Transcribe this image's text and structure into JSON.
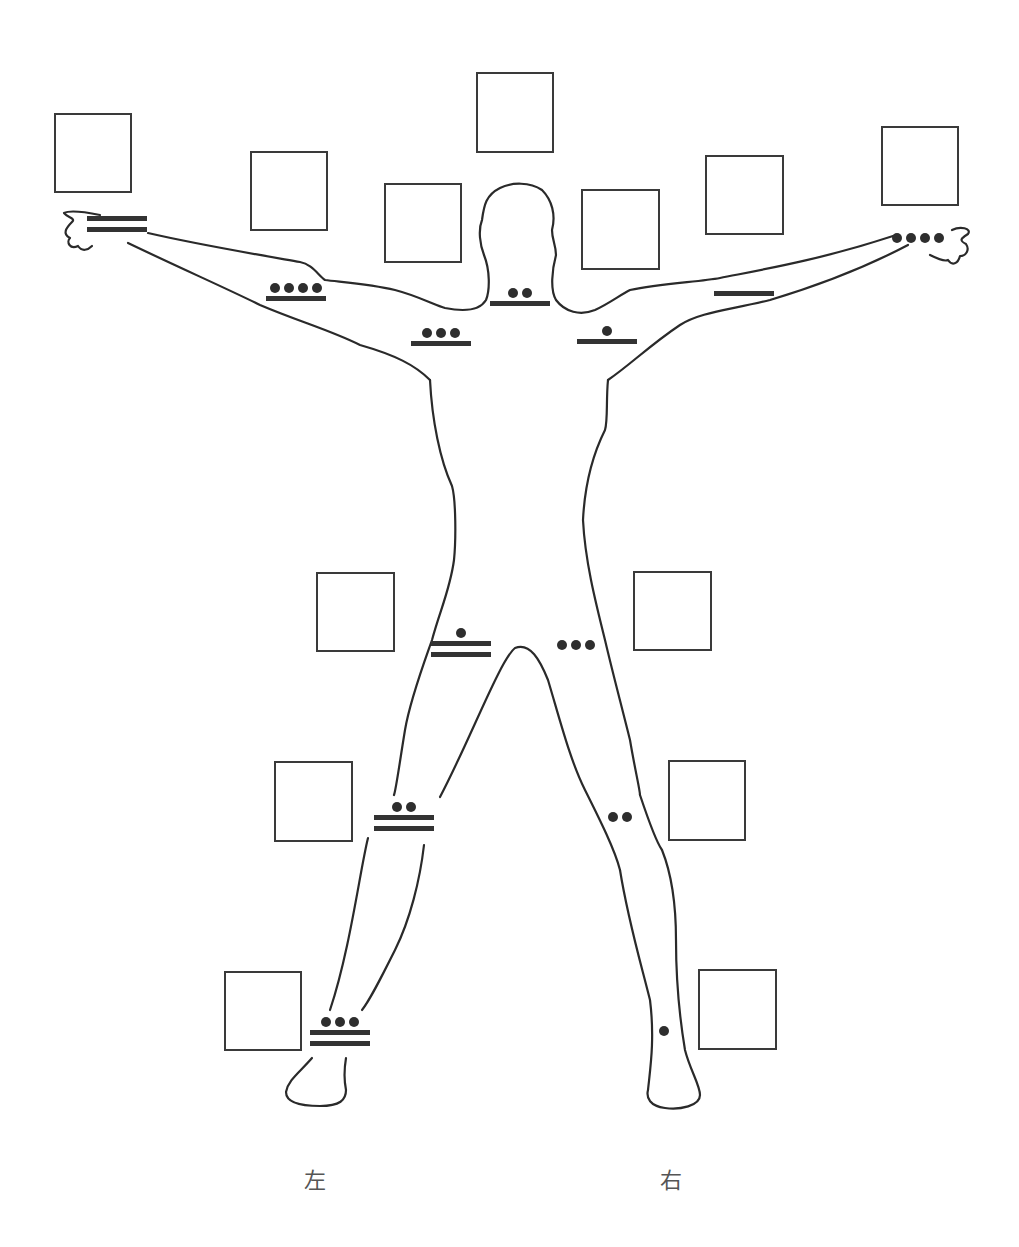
{
  "diagram": {
    "labels": {
      "left": "左",
      "right": "右"
    },
    "numerals": [
      {
        "id": "left-hand",
        "bars": 2,
        "dots": 0,
        "value": 10
      },
      {
        "id": "left-elbow",
        "bars": 1,
        "dots": 4,
        "value": 9
      },
      {
        "id": "left-shoulder",
        "bars": 1,
        "dots": 3,
        "value": 8
      },
      {
        "id": "neck",
        "bars": 1,
        "dots": 2,
        "value": 7
      },
      {
        "id": "right-shoulder",
        "bars": 1,
        "dots": 1,
        "value": 6
      },
      {
        "id": "right-elbow",
        "bars": 1,
        "dots": 0,
        "value": 5
      },
      {
        "id": "right-hand",
        "bars": 0,
        "dots": 4,
        "value": 4
      },
      {
        "id": "left-hip",
        "bars": 2,
        "dots": 1,
        "value": 11
      },
      {
        "id": "right-hip",
        "bars": 0,
        "dots": 3,
        "value": 3
      },
      {
        "id": "left-knee",
        "bars": 2,
        "dots": 2,
        "value": 12
      },
      {
        "id": "right-knee",
        "bars": 0,
        "dots": 2,
        "value": 2
      },
      {
        "id": "left-ankle",
        "bars": 2,
        "dots": 3,
        "value": 13
      },
      {
        "id": "right-ankle",
        "bars": 0,
        "dots": 1,
        "value": 1
      }
    ],
    "answer_boxes": [
      "left-hand",
      "left-elbow",
      "left-shoulder",
      "head",
      "right-shoulder",
      "right-elbow",
      "right-hand",
      "left-hip",
      "right-hip",
      "left-knee",
      "right-knee",
      "left-ankle",
      "right-ankle"
    ]
  }
}
